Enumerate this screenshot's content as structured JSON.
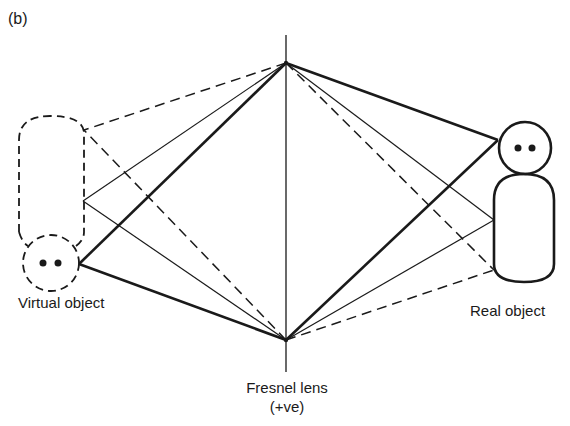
{
  "figure": {
    "panel_label": "(b)",
    "labels": {
      "virtual_object": "Virtual object",
      "real_object": "Real object",
      "lens_name": "Fresnel lens",
      "lens_sign": "(+ve)"
    },
    "colors": {
      "ink": "#1a1a1a",
      "background": "#ffffff"
    },
    "elements": {
      "lens_axis": {
        "x": 286,
        "y_top": 35,
        "y_bottom": 372
      },
      "lens_points": {
        "top": [
          286,
          63
        ],
        "bottom": [
          286,
          340
        ]
      },
      "real_object": {
        "style": "solid",
        "head_center": [
          525,
          148
        ],
        "head_radius": 26
      },
      "virtual_object": {
        "style": "dashed",
        "head_center": [
          50,
          262
        ],
        "head_radius": 28
      }
    },
    "ray_types": [
      "thick solid",
      "thin solid",
      "dashed"
    ]
  }
}
